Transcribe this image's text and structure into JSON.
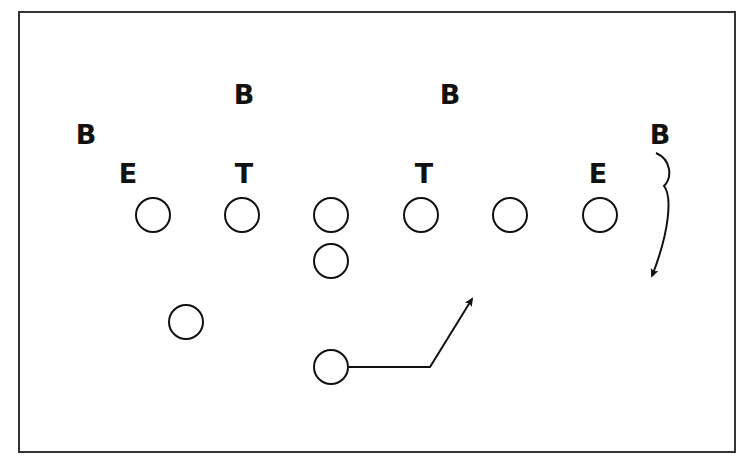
{
  "diagram": {
    "type": "football-play",
    "colors": {
      "ink": "#111111",
      "background": "#ffffff",
      "frame": "#333333"
    },
    "defense": [
      {
        "label": "B",
        "x": 244,
        "y": 104,
        "role": "linebacker-left"
      },
      {
        "label": "B",
        "x": 450,
        "y": 104,
        "role": "linebacker-right"
      },
      {
        "label": "B",
        "x": 86,
        "y": 144,
        "role": "back-left"
      },
      {
        "label": "B",
        "x": 660,
        "y": 144,
        "role": "back-right"
      },
      {
        "label": "E",
        "x": 128,
        "y": 183,
        "role": "end-left"
      },
      {
        "label": "T",
        "x": 244,
        "y": 183,
        "role": "tackle-left"
      },
      {
        "label": "T",
        "x": 424,
        "y": 183,
        "role": "tackle-right"
      },
      {
        "label": "E",
        "x": 598,
        "y": 183,
        "role": "end-right"
      }
    ],
    "offense": [
      {
        "x": 153,
        "y": 215,
        "role": "lineman-1"
      },
      {
        "x": 242,
        "y": 215,
        "role": "lineman-2"
      },
      {
        "x": 331,
        "y": 215,
        "role": "center"
      },
      {
        "x": 421,
        "y": 215,
        "role": "lineman-4"
      },
      {
        "x": 510,
        "y": 215,
        "role": "lineman-5"
      },
      {
        "x": 600,
        "y": 215,
        "role": "lineman-6"
      },
      {
        "x": 331,
        "y": 261,
        "role": "quarterback"
      },
      {
        "x": 186,
        "y": 322,
        "role": "halfback"
      },
      {
        "x": 331,
        "y": 367,
        "role": "ball-carrier"
      }
    ],
    "routes": [
      {
        "name": "ball-carrier-route",
        "points": "349,367 430,367 472,299"
      },
      {
        "name": "defender-pursuit-route",
        "path": "M656,153 C672,160 672,178 664,186 C672,196 670,230 652,276"
      }
    ]
  }
}
